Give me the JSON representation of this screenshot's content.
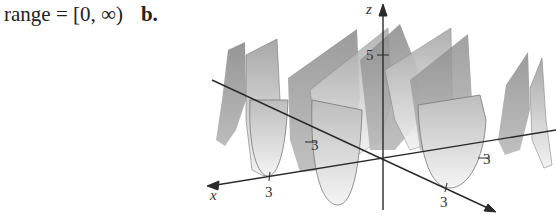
{
  "caption": {
    "text": "range = [0, ∞)",
    "part_label": "b."
  },
  "figure": {
    "axes": {
      "x_label": "x",
      "y_label": "y",
      "z_label": "z"
    },
    "ticks": {
      "x_tick": "3",
      "neg_x_tick": "3",
      "y_tick": "3",
      "neg_y_tick": "3",
      "z_tick": "5"
    }
  }
}
